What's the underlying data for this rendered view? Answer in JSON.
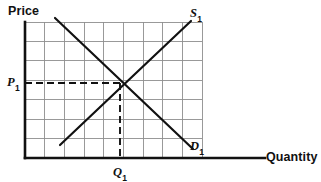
{
  "figure": {
    "background_color": "#ffffff",
    "ink_color": "#111111",
    "grid_color": "#8e8e8e"
  },
  "axes": {
    "y_axis_label": "Price",
    "x_axis_label": "Quantity",
    "origin_px": {
      "x": 25,
      "y": 158
    },
    "x_axis_end_px": {
      "x": 265,
      "y": 158
    },
    "y_axis_top_px": {
      "x": 25,
      "y": 22
    }
  },
  "grid": {
    "left": 25,
    "top": 22,
    "right": 202,
    "bottom": 158,
    "columns": 9,
    "rows": 7,
    "cell_width": 19.7,
    "cell_height": 19.4,
    "visible": true
  },
  "curves": [
    {
      "id": "supply",
      "label": "S",
      "subscript": "1",
      "x1": 60,
      "y1": 145,
      "x2": 191,
      "y2": 21,
      "stroke_width": 2.2
    },
    {
      "id": "demand",
      "label": "D",
      "subscript": "1",
      "x1": 55,
      "y1": 18,
      "x2": 193,
      "y2": 149,
      "stroke_width": 2.2
    }
  ],
  "equilibrium": {
    "x_px": 120,
    "y_px": 83,
    "price_label": "P",
    "price_subscript": "1",
    "quantity_label": "Q",
    "quantity_subscript": "1",
    "dashed_price_line": {
      "x1": 25,
      "y1": 83,
      "x2": 120,
      "y2": 83
    },
    "dashed_quantity_line": {
      "x1": 120,
      "y1": 83,
      "x2": 120,
      "y2": 158
    },
    "dash_pattern": "7,4"
  },
  "chart_data": {
    "type": "line",
    "xlabel": "Quantity",
    "ylabel": "Price",
    "grid": true,
    "legend": "inline-curve-labels",
    "xlim": [
      0,
      9
    ],
    "ylim": [
      0,
      7
    ],
    "series": [
      {
        "name": "S1",
        "label": "S₁",
        "description": "Upward-sloping supply curve",
        "x": [
          1.8,
          8.4
        ],
        "y": [
          0.67,
          7.05
        ]
      },
      {
        "name": "D1",
        "label": "D₁",
        "description": "Downward-sloping demand curve",
        "x": [
          1.5,
          8.5
        ],
        "y": [
          7.2,
          0.46
        ]
      }
    ],
    "annotations": [
      {
        "text": "P₁",
        "x": 0,
        "y": 3.86,
        "note": "equilibrium price on vertical axis"
      },
      {
        "text": "Q₁",
        "x": 4.82,
        "y": 0,
        "note": "equilibrium quantity on horizontal axis"
      },
      {
        "text": "S₁",
        "x": 8.6,
        "y": 7.2,
        "note": "supply curve label"
      },
      {
        "text": "D₁",
        "x": 8.6,
        "y": 0.6,
        "note": "demand curve label"
      }
    ],
    "equilibrium_point": {
      "x": 4.82,
      "y": 3.86
    }
  }
}
